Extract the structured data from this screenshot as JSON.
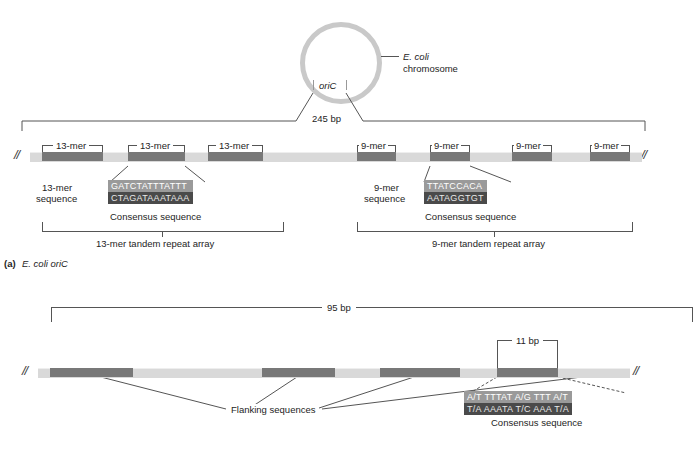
{
  "figure": {
    "panel_a_caption_prefix": "(a)",
    "panel_a_caption": "E. coli oriC"
  },
  "chromosome": {
    "oric_label": "oriC",
    "callout_line1": "E. coli",
    "callout_line2": "chromosome",
    "span_label": "245 bp"
  },
  "panel_a": {
    "thirteen": {
      "repeat_label": "13-mer",
      "count": 3,
      "seq_label_line1": "13-mer",
      "seq_label_line2": "sequence",
      "consensus_top": "GATCTATTTATTT",
      "consensus_bottom": "CTAGATAAATAAA",
      "consensus_caption": "Consensus sequence",
      "array_label": "13-mer tandem repeat array"
    },
    "nine": {
      "repeat_label": "9-mer",
      "count": 4,
      "seq_label_line1": "9-mer",
      "seq_label_line2": "sequence",
      "consensus_top": "TTATCCACA",
      "consensus_bottom": "AATAGGTGT",
      "consensus_caption": "Consensus sequence",
      "array_label": "9-mer tandem repeat array"
    }
  },
  "panel_b": {
    "span_label": "95 bp",
    "element_span_label": "11 bp",
    "flanking_label": "Flanking sequences",
    "consensus_top": "A/T TTTAT A/G TTT A/T",
    "consensus_bottom": "T/A AAATA T/C AAA T/A",
    "consensus_caption": "Consensus sequence"
  },
  "breaks": {
    "mark": "//"
  },
  "colors": {
    "backbone": "#d9d9d9",
    "segment": "#787878",
    "seqbox_top": "#9a9a9a",
    "seqbox_bottom": "#4a4a4a",
    "circle": "#c9c9c9",
    "line": "#555555"
  }
}
